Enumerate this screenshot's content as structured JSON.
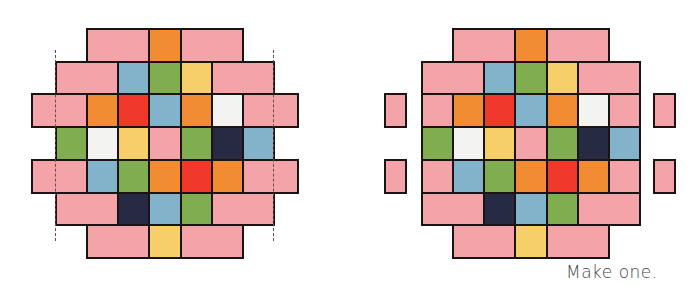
{
  "figure": {
    "caption": "Make one.",
    "colors": {
      "pink": "#f4a4a8",
      "orange": "#f28c32",
      "blue": "#82b3cb",
      "green": "#7fad4f",
      "yellow": "#f7cf69",
      "red": "#f0392b",
      "white": "#f3f3f1",
      "navy": "#262a42",
      "border": "#1c1414"
    },
    "grid": {
      "rows": 7,
      "cols": 7,
      "description": "Diamond-shaped quilt block of colored squares and pink rectangles"
    },
    "layout_rows": [
      [
        {
          "c": "pink",
          "span": 2,
          "start": 1
        },
        {
          "c": "orange",
          "span": 1,
          "start": 3
        },
        {
          "c": "pink",
          "span": 2,
          "start": 4
        }
      ],
      [
        {
          "c": "pink",
          "span": 2,
          "start": 0
        },
        {
          "c": "blue",
          "span": 1,
          "start": 2
        },
        {
          "c": "green",
          "span": 1,
          "start": 3
        },
        {
          "c": "yellow",
          "span": 1,
          "start": 4
        },
        {
          "c": "pink",
          "span": 2,
          "start": 5
        }
      ],
      [
        {
          "c": "pink",
          "span": 1,
          "start": 0,
          "ext": "left"
        },
        {
          "c": "orange",
          "span": 1,
          "start": 1
        },
        {
          "c": "red",
          "span": 1,
          "start": 2
        },
        {
          "c": "blue",
          "span": 1,
          "start": 3
        },
        {
          "c": "orange",
          "span": 1,
          "start": 4
        },
        {
          "c": "white",
          "span": 1,
          "start": 5
        },
        {
          "c": "pink",
          "span": 1,
          "start": 6,
          "ext": "right"
        }
      ],
      [
        {
          "c": "green",
          "span": 1,
          "start": 0
        },
        {
          "c": "white",
          "span": 1,
          "start": 1
        },
        {
          "c": "yellow",
          "span": 1,
          "start": 2
        },
        {
          "c": "pink",
          "span": 1,
          "start": 3
        },
        {
          "c": "green",
          "span": 1,
          "start": 4
        },
        {
          "c": "navy",
          "span": 1,
          "start": 5
        },
        {
          "c": "blue",
          "span": 1,
          "start": 6
        }
      ],
      [
        {
          "c": "pink",
          "span": 1,
          "start": 0,
          "ext": "left"
        },
        {
          "c": "blue",
          "span": 1,
          "start": 1
        },
        {
          "c": "green",
          "span": 1,
          "start": 2
        },
        {
          "c": "orange",
          "span": 1,
          "start": 3
        },
        {
          "c": "red",
          "span": 1,
          "start": 4
        },
        {
          "c": "orange",
          "span": 1,
          "start": 5
        },
        {
          "c": "pink",
          "span": 1,
          "start": 6,
          "ext": "right"
        }
      ],
      [
        {
          "c": "pink",
          "span": 2,
          "start": 0
        },
        {
          "c": "navy",
          "span": 1,
          "start": 2
        },
        {
          "c": "blue",
          "span": 1,
          "start": 3
        },
        {
          "c": "green",
          "span": 1,
          "start": 4
        },
        {
          "c": "pink",
          "span": 2,
          "start": 5
        }
      ],
      [
        {
          "c": "pink",
          "span": 2,
          "start": 1
        },
        {
          "c": "yellow",
          "span": 1,
          "start": 3
        },
        {
          "c": "pink",
          "span": 2,
          "start": 4
        }
      ]
    ],
    "panels": [
      {
        "name": "assembled",
        "x0": 55,
        "y0": 28,
        "cell_w": 31.15,
        "cell_h": 32.7,
        "ext_w": 24,
        "mode": "joined",
        "dashed_x": [
          55,
          273
        ],
        "dashed_y": [
          50,
          241
        ]
      },
      {
        "name": "exploded",
        "x0": 421,
        "y0": 28,
        "cell_w": 31.15,
        "cell_h": 32.7,
        "ext_w": 23,
        "ext_gap": 14,
        "mode": "detached"
      }
    ]
  }
}
